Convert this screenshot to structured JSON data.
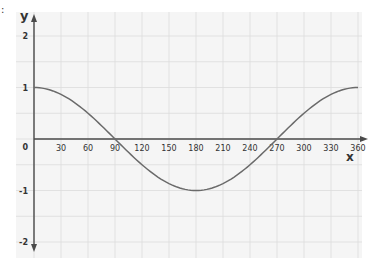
{
  "corner_mark": ":",
  "chart_data": {
    "type": "line",
    "title": "",
    "xlabel": "x",
    "ylabel": "y",
    "function": "cos(x)",
    "xlim": [
      0,
      360
    ],
    "ylim": [
      -2,
      2
    ],
    "grid": true,
    "x_ticks": [
      30,
      60,
      90,
      120,
      150,
      180,
      210,
      240,
      270,
      300,
      330,
      360
    ],
    "y_ticks": [
      2,
      1,
      0,
      -1,
      -2
    ],
    "origin_label": "0",
    "series": [
      {
        "name": "y = cos x",
        "x": [
          0,
          30,
          60,
          90,
          120,
          150,
          180,
          210,
          240,
          270,
          300,
          330,
          360
        ],
        "values": [
          1,
          0.866,
          0.5,
          0,
          -0.5,
          -0.866,
          -1,
          -0.866,
          -0.5,
          0,
          0.5,
          0.866,
          1
        ]
      }
    ]
  },
  "colors": {
    "background": "#ffffff",
    "paper": "#f5f5f5",
    "grid": "#dcdcdc",
    "axis": "#4a4a4a",
    "curve": "#6a6a6a",
    "text": "#333333"
  }
}
